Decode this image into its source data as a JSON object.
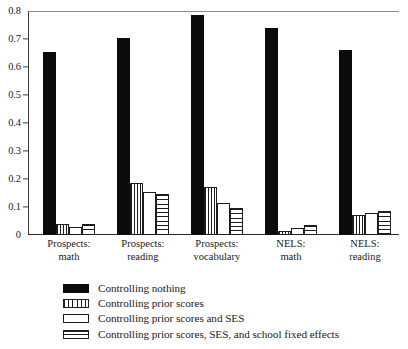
{
  "chart_data": {
    "type": "bar",
    "title": "",
    "subtitle": "",
    "xlabel": "",
    "ylabel": "",
    "ylim": [
      0,
      0.8
    ],
    "yticks": [
      "0",
      "0.1",
      "0.2",
      "0.3",
      "0.4",
      "0.5",
      "0.6",
      "0.7",
      "0.8"
    ],
    "ytick_values": [
      0,
      0.1,
      0.2,
      0.3,
      0.4,
      0.5,
      0.6,
      0.7,
      0.8
    ],
    "grid": false,
    "legend_position": "below-plot-left",
    "categories": [
      "Prospects: math",
      "Prospects: reading",
      "Prospects: vocabulary",
      "NELS: math",
      "NELS: reading"
    ],
    "category_lines": [
      [
        "Prospects:",
        "math"
      ],
      [
        "Prospects:",
        "reading"
      ],
      [
        "Prospects:",
        "vocabulary"
      ],
      [
        "NELS:",
        "math"
      ],
      [
        "NELS:",
        "reading"
      ]
    ],
    "series": [
      {
        "name": "Controlling nothing",
        "pattern": "solid-black",
        "values": [
          0.655,
          0.705,
          0.785,
          0.74,
          0.66
        ]
      },
      {
        "name": "Controlling prior scores",
        "pattern": "vertical-stripes",
        "values": [
          0.04,
          0.185,
          0.17,
          0.015,
          0.07
        ]
      },
      {
        "name": "Controlling prior scores and SES",
        "pattern": "empty-white",
        "values": [
          0.03,
          0.155,
          0.115,
          0.025,
          0.08
        ]
      },
      {
        "name": "Controlling prior scores, SES, and school fixed effects",
        "pattern": "horizontal-stripes",
        "values": [
          0.04,
          0.145,
          0.095,
          0.035,
          0.085
        ]
      }
    ]
  },
  "colors": {
    "series_solid": "#0b0b0b",
    "pattern_line": "#1d1d1d",
    "background": "#ffffff",
    "axis": "#2a2a2a",
    "frame_top": "#8d8d8d"
  }
}
